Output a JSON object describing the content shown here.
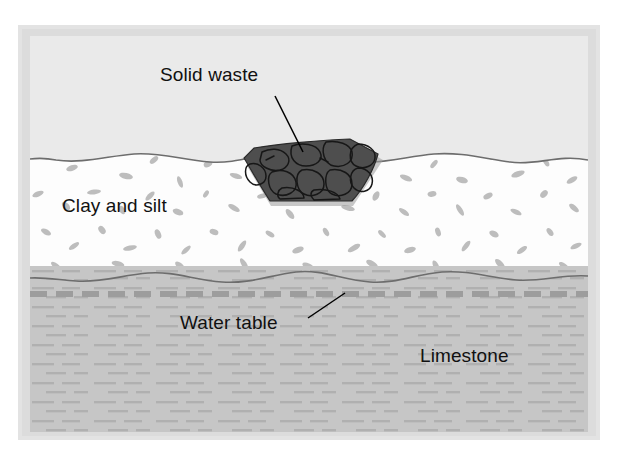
{
  "figure": {
    "type": "geological-cross-section",
    "labels": {
      "solid_waste": "Solid waste",
      "clay_and_silt": "Clay and silt",
      "water_table": "Water table",
      "limestone": "Limestone"
    },
    "layers": [
      {
        "name": "air",
        "label": "",
        "fill": "#eaeaea",
        "top": 0,
        "height": 130
      },
      {
        "name": "clay-and-silt",
        "label": "Clay and silt",
        "fill": "#fdfdfd",
        "speckle": "#b9b9b9",
        "top": 110,
        "height": 135
      },
      {
        "name": "limestone",
        "label": "Limestone",
        "fill": "#c6c6c6",
        "texture": "#b0b0b0",
        "top": 230,
        "height": 166
      }
    ],
    "features": [
      {
        "name": "solid-waste-mass",
        "label": "Solid waste",
        "fill": "#4a4a4a",
        "outline": "#1d1d1d",
        "shape": "trapezoid"
      },
      {
        "name": "water-table",
        "label": "Water table",
        "stroke": "#9a9a9a",
        "style": "dashed"
      }
    ],
    "colors": {
      "background": "#ffffff",
      "frame": "#e3e3e3",
      "air": "#eaeaea",
      "clay": "#fdfdfd",
      "clay_speckle": "#bcbcbc",
      "limestone": "#c6c6c6",
      "limestone_dash": "#b2b2b2",
      "waste_dark": "#4a4a4a",
      "waste_outline": "#1c1c1c",
      "boundary_line": "#6e6e6e",
      "water_table": "#9a9a9a",
      "label_text": "#111111",
      "leader_line": "#000000"
    }
  }
}
